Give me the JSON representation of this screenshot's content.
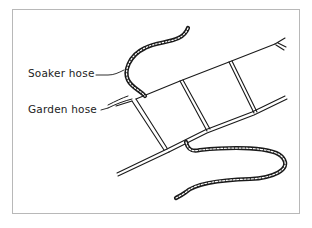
{
  "figure": {
    "labels": [
      {
        "id": "soaker",
        "text": "Soaker hose"
      },
      {
        "id": "garden",
        "text": "Garden hose"
      }
    ],
    "colors": {
      "line": "#1a1a1a",
      "frame": "#b8b8b8",
      "background": "#ffffff"
    }
  }
}
